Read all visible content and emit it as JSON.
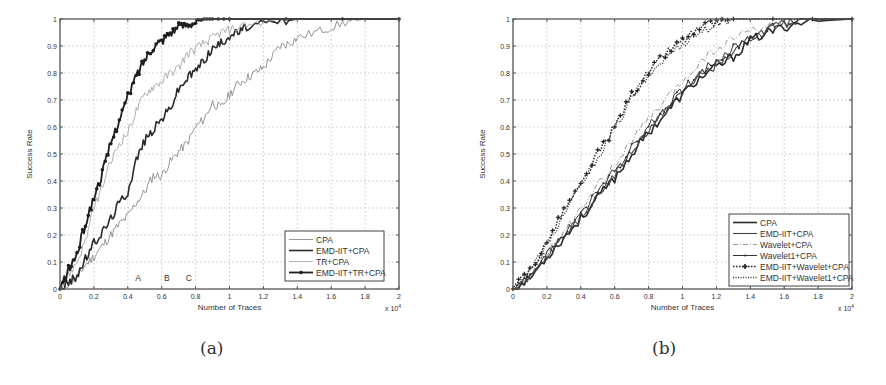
{
  "captions": {
    "a": "(a)",
    "b": "(b)"
  },
  "chart_data": [
    {
      "panel": "(a)",
      "type": "line",
      "title": "",
      "xlabel": "Number of Traces",
      "ylabel": "Success Rate",
      "x_multiplier": "x 10^4",
      "x_multiplier_label": "x 10",
      "x_multiplier_exp": "4",
      "xlim": [
        0,
        2
      ],
      "ylim": [
        0,
        1
      ],
      "xticks": [
        "0",
        "0.2",
        "0.4",
        "0.6",
        "0.8",
        "1",
        "1.2",
        "1.4",
        "1.6",
        "1.8",
        "2"
      ],
      "yticks": [
        "0",
        "0.1",
        "0.2",
        "0.3",
        "0.4",
        "0.5",
        "0.6",
        "0.7",
        "0.8",
        "0.9",
        "1"
      ],
      "grid": true,
      "legend_position": "lower right",
      "annotations": [
        {
          "text": "A",
          "x": 0.46,
          "y": 0.03
        },
        {
          "text": "B",
          "x": 0.63,
          "y": 0.03
        },
        {
          "text": "C",
          "x": 0.76,
          "y": 0.03
        }
      ],
      "series": [
        {
          "name": "CPA",
          "style": "thin-gray",
          "x": [
            0,
            0.05,
            0.1,
            0.15,
            0.2,
            0.25,
            0.3,
            0.35,
            0.4,
            0.45,
            0.5,
            0.55,
            0.6,
            0.65,
            0.7,
            0.75,
            0.8,
            0.85,
            0.9,
            0.95,
            1.0,
            1.05,
            1.1,
            1.15,
            1.2,
            1.25,
            1.3,
            1.35,
            1.4,
            1.5,
            1.6,
            1.7,
            1.8,
            2.0
          ],
          "values": [
            0,
            0.02,
            0.04,
            0.09,
            0.12,
            0.16,
            0.2,
            0.24,
            0.27,
            0.32,
            0.36,
            0.42,
            0.42,
            0.47,
            0.51,
            0.54,
            0.6,
            0.63,
            0.69,
            0.67,
            0.72,
            0.76,
            0.78,
            0.8,
            0.82,
            0.86,
            0.9,
            0.91,
            0.93,
            0.95,
            0.97,
            0.99,
            1.0,
            1.0
          ]
        },
        {
          "name": "EMD-IIT+CPA",
          "style": "thick-dark",
          "x": [
            0,
            0.05,
            0.1,
            0.15,
            0.2,
            0.25,
            0.3,
            0.35,
            0.4,
            0.45,
            0.5,
            0.55,
            0.6,
            0.65,
            0.7,
            0.75,
            0.8,
            0.85,
            0.9,
            0.95,
            1.0,
            1.05,
            1.1,
            1.2,
            1.3,
            1.4,
            2.0
          ],
          "values": [
            0,
            0.02,
            0.05,
            0.11,
            0.17,
            0.21,
            0.26,
            0.32,
            0.36,
            0.48,
            0.55,
            0.59,
            0.63,
            0.67,
            0.74,
            0.78,
            0.81,
            0.85,
            0.89,
            0.91,
            0.94,
            0.95,
            0.97,
            0.98,
            0.99,
            1.0,
            1.0
          ]
        },
        {
          "name": "TR+CPA",
          "style": "thin-light",
          "x": [
            0,
            0.05,
            0.1,
            0.15,
            0.2,
            0.25,
            0.3,
            0.35,
            0.4,
            0.45,
            0.5,
            0.55,
            0.6,
            0.65,
            0.7,
            0.75,
            0.8,
            0.85,
            0.9,
            0.95,
            1.0,
            1.1,
            1.2,
            1.3,
            2.0
          ],
          "values": [
            0,
            0.05,
            0.1,
            0.18,
            0.3,
            0.38,
            0.47,
            0.54,
            0.58,
            0.66,
            0.72,
            0.75,
            0.77,
            0.8,
            0.82,
            0.87,
            0.89,
            0.91,
            0.93,
            0.95,
            0.96,
            0.98,
            0.99,
            1.0,
            1.0
          ]
        },
        {
          "name": "EMD-IIT+TR+CPA",
          "style": "thick-dark-dot-marker",
          "x": [
            0,
            0.05,
            0.1,
            0.15,
            0.2,
            0.25,
            0.3,
            0.35,
            0.4,
            0.45,
            0.5,
            0.55,
            0.6,
            0.65,
            0.7,
            0.75,
            0.8,
            0.85,
            0.9,
            1.0,
            2.0
          ],
          "values": [
            0,
            0.07,
            0.13,
            0.24,
            0.34,
            0.43,
            0.54,
            0.63,
            0.71,
            0.79,
            0.85,
            0.9,
            0.92,
            0.95,
            0.97,
            0.98,
            0.99,
            1.0,
            1.0,
            1.0,
            1.0
          ]
        }
      ]
    },
    {
      "panel": "(b)",
      "type": "line",
      "title": "",
      "xlabel": "Number of Traces",
      "ylabel": "Success Rate",
      "x_multiplier": "x 10^4",
      "x_multiplier_label": "x 10",
      "x_multiplier_exp": "4",
      "xlim": [
        0,
        2
      ],
      "ylim": [
        0,
        1
      ],
      "xticks": [
        "0",
        "0.2",
        "0.4",
        "0.6",
        "0.8",
        "1",
        "1.2",
        "1.4",
        "1.6",
        "1.8",
        "2"
      ],
      "yticks": [
        "0",
        "0.1",
        "0.2",
        "0.3",
        "0.4",
        "0.5",
        "0.6",
        "0.7",
        "0.8",
        "0.9",
        "1"
      ],
      "grid": true,
      "legend_position": "lower right",
      "series": [
        {
          "name": "CPA",
          "style": "thick-dark",
          "x": [
            0,
            0.1,
            0.2,
            0.3,
            0.4,
            0.5,
            0.6,
            0.7,
            0.8,
            0.9,
            1.0,
            1.1,
            1.2,
            1.3,
            1.4,
            1.5,
            1.6,
            1.7,
            2.0
          ],
          "values": [
            0,
            0.04,
            0.12,
            0.19,
            0.26,
            0.34,
            0.41,
            0.5,
            0.58,
            0.65,
            0.72,
            0.78,
            0.82,
            0.86,
            0.92,
            0.95,
            0.97,
            0.99,
            1.0
          ]
        },
        {
          "name": "EMD-IIT+CPA",
          "style": "thin-dark",
          "x": [
            0,
            0.1,
            0.2,
            0.3,
            0.4,
            0.5,
            0.6,
            0.7,
            0.8,
            0.9,
            1.0,
            1.1,
            1.2,
            1.3,
            1.4,
            1.5,
            1.6,
            1.7,
            2.0
          ],
          "values": [
            0,
            0.05,
            0.13,
            0.2,
            0.27,
            0.35,
            0.42,
            0.51,
            0.59,
            0.66,
            0.73,
            0.79,
            0.83,
            0.87,
            0.93,
            0.96,
            0.98,
            1.0,
            1.0
          ]
        },
        {
          "name": "Wavelet+CPA",
          "style": "dash-dot-gray",
          "x": [
            0,
            0.1,
            0.2,
            0.3,
            0.4,
            0.5,
            0.6,
            0.7,
            0.8,
            0.9,
            1.0,
            1.1,
            1.2,
            1.3,
            1.4,
            1.5,
            1.6,
            1.7,
            2.0
          ],
          "values": [
            0,
            0.05,
            0.13,
            0.21,
            0.29,
            0.38,
            0.46,
            0.55,
            0.63,
            0.7,
            0.77,
            0.84,
            0.89,
            0.93,
            0.96,
            0.97,
            0.99,
            1.0,
            1.0
          ]
        },
        {
          "name": "Wavelet1+CPA",
          "style": "thin-dark-dot-marker",
          "x": [
            0,
            0.1,
            0.2,
            0.3,
            0.4,
            0.5,
            0.6,
            0.7,
            0.8,
            0.9,
            1.0,
            1.1,
            1.2,
            1.3,
            1.4,
            1.5,
            1.6,
            1.7,
            2.0
          ],
          "values": [
            0,
            0.05,
            0.12,
            0.2,
            0.27,
            0.36,
            0.44,
            0.52,
            0.6,
            0.67,
            0.74,
            0.8,
            0.85,
            0.89,
            0.93,
            0.96,
            0.98,
            1.0,
            1.0
          ]
        },
        {
          "name": "EMD-IIT+Wavelet+CPA",
          "style": "dotted-plus-marker",
          "x": [
            0,
            0.1,
            0.2,
            0.3,
            0.4,
            0.5,
            0.6,
            0.7,
            0.8,
            0.9,
            1.0,
            1.1,
            1.2,
            1.3,
            2.0
          ],
          "values": [
            0,
            0.07,
            0.17,
            0.29,
            0.38,
            0.5,
            0.6,
            0.72,
            0.8,
            0.87,
            0.92,
            0.96,
            0.99,
            1.0,
            1.0
          ]
        },
        {
          "name": "EMD-IIT+Wavelet1+CPA",
          "style": "dotted-dark",
          "x": [
            0,
            0.1,
            0.2,
            0.3,
            0.4,
            0.5,
            0.6,
            0.7,
            0.8,
            0.9,
            1.0,
            1.1,
            1.2,
            1.3,
            2.0
          ],
          "values": [
            0,
            0.07,
            0.16,
            0.28,
            0.38,
            0.49,
            0.59,
            0.71,
            0.79,
            0.86,
            0.91,
            0.95,
            0.98,
            1.0,
            1.0
          ]
        }
      ]
    }
  ]
}
